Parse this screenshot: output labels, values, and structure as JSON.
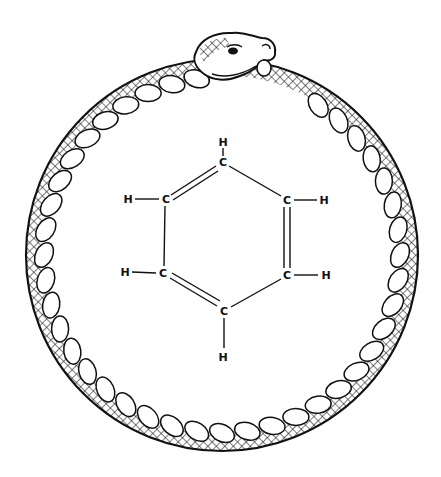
{
  "illustration": {
    "subject": "ouroboros-benzene",
    "ring": {
      "cx": 222,
      "cy": 255,
      "r_outer": 196,
      "r_inner": 172,
      "scale_count": 44
    },
    "colors": {
      "ink": "#111111",
      "background": "#ffffff"
    },
    "molecule": {
      "name": "benzene",
      "atoms": [
        {
          "id": "c1",
          "label": "C",
          "x": 223,
          "y": 162
        },
        {
          "id": "c2",
          "label": "C",
          "x": 287,
          "y": 200
        },
        {
          "id": "c3",
          "label": "C",
          "x": 287,
          "y": 275
        },
        {
          "id": "c4",
          "label": "C",
          "x": 224,
          "y": 311
        },
        {
          "id": "c5",
          "label": "C",
          "x": 163,
          "y": 273
        },
        {
          "id": "c6",
          "label": "C",
          "x": 166,
          "y": 199
        },
        {
          "id": "h1",
          "label": "H",
          "x": 223,
          "y": 142
        },
        {
          "id": "h2",
          "label": "H",
          "x": 324,
          "y": 200
        },
        {
          "id": "h3",
          "label": "H",
          "x": 326,
          "y": 275
        },
        {
          "id": "h4",
          "label": "H",
          "x": 223,
          "y": 357
        },
        {
          "id": "h5",
          "label": "H",
          "x": 125,
          "y": 272
        },
        {
          "id": "h6",
          "label": "H",
          "x": 128,
          "y": 199
        }
      ]
    }
  }
}
